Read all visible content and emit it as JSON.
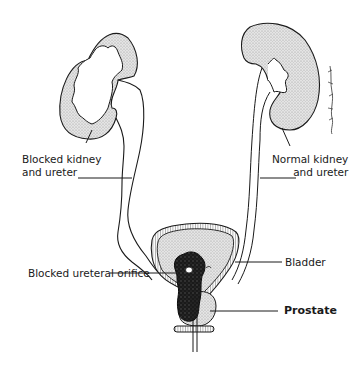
{
  "diagram": {
    "type": "anatomical illustration",
    "labels": {
      "blocked_kidney_line1": "Blocked kidney",
      "blocked_kidney_line2": "and ureter",
      "normal_kidney_line1": "Normal kidney",
      "normal_kidney_line2": "and ureter",
      "bladder": "Bladder",
      "blocked_orifice": "Blocked ureteral orifice",
      "prostate": "Prostate"
    },
    "colors": {
      "stroke": "#1a1a1a",
      "fill_stipple": "#d6d6d6",
      "mass": "#111111",
      "background": "#ffffff"
    }
  }
}
